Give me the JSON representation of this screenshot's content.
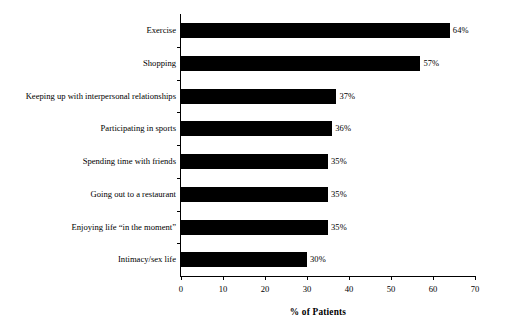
{
  "chart_data": {
    "type": "bar",
    "orientation": "horizontal",
    "title": "",
    "xlabel": "% of Patients",
    "ylabel": "",
    "xlim": [
      0,
      70
    ],
    "xticks": [
      0,
      10,
      20,
      30,
      40,
      50,
      60,
      70
    ],
    "grid": false,
    "legend": null,
    "value_label_suffix": "%",
    "bar_color": "#000000",
    "categories": [
      "Exercise",
      "Shopping",
      "Keeping up with interpersonal relationships",
      "Participating in sports",
      "Spending time with friends",
      "Going out to a restaurant",
      "Enjoying life “in the moment”",
      "Intimacy/sex life"
    ],
    "values": [
      64,
      57,
      37,
      36,
      35,
      35,
      35,
      30
    ],
    "value_labels": [
      "64%",
      "57%",
      "37%",
      "36%",
      "35%",
      "35%",
      "35%",
      "30%"
    ],
    "xtick_labels": [
      "0",
      "10",
      "20",
      "30",
      "40",
      "50",
      "60",
      "70"
    ]
  }
}
